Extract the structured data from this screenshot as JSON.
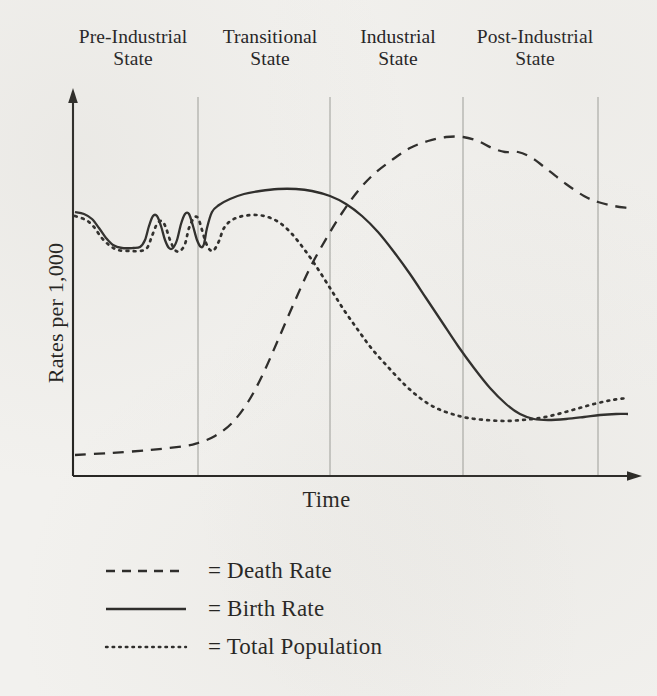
{
  "figure": {
    "stages": [
      {
        "name": "pre-industrial",
        "line1": "Pre-Industrial",
        "line2": "State"
      },
      {
        "name": "transitional",
        "line1": "Transitional",
        "line2": "State"
      },
      {
        "name": "industrial",
        "line1": "Industrial",
        "line2": "State"
      },
      {
        "name": "post-industrial",
        "line1": "Post-Industrial",
        "line2": "State"
      }
    ],
    "y_axis_title": "Rates per 1,000",
    "x_axis_title": "Time",
    "legend": [
      {
        "key": "death",
        "style": "dashed",
        "label": "= Death Rate"
      },
      {
        "key": "birth",
        "style": "solid",
        "label": "= Birth Rate"
      },
      {
        "key": "population",
        "style": "dotted",
        "label": "= Total Population"
      }
    ],
    "colors": {
      "page_background": "#f2f1ee",
      "ink": "#1f1e1c",
      "curve": "#2b2a28",
      "divider": "#b9b8b4",
      "axis": "#262522"
    }
  },
  "chart_data": {
    "type": "line",
    "title": "",
    "subtitle": "",
    "xlabel": "Time",
    "ylabel": "Rates per 1,000",
    "grid": false,
    "legend_position": "below-plot",
    "axes": {
      "x_origin_px": 73,
      "x_end_px": 640,
      "y_top_px": 90,
      "y_baseline_px": 476,
      "x_arrow": true,
      "y_arrow": true,
      "tick_labels_x": [],
      "tick_labels_y": []
    },
    "stage_dividers_px": [
      198,
      330,
      463,
      598
    ],
    "stage_spans": [
      {
        "stage": "Pre-Industrial State",
        "from_px": 73,
        "to_px": 198
      },
      {
        "stage": "Transitional State",
        "from_px": 198,
        "to_px": 330
      },
      {
        "stage": "Industrial State",
        "from_px": 330,
        "to_px": 463
      },
      {
        "stage": "Post-Industrial State",
        "from_px": 463,
        "to_px": 598
      }
    ],
    "note": "Demographic transition model. Values are relative rates read off pixel positions; y is inverted (smaller px = higher rate). No numeric tick labels appear on either axis.",
    "series": [
      {
        "name": "Death Rate",
        "style": "dashed",
        "points_px": [
          [
            75,
            455
          ],
          [
            110,
            453
          ],
          [
            150,
            450
          ],
          [
            185,
            446
          ],
          [
            198,
            443
          ],
          [
            215,
            436
          ],
          [
            232,
            423
          ],
          [
            248,
            402
          ],
          [
            263,
            374
          ],
          [
            278,
            340
          ],
          [
            294,
            303
          ],
          [
            310,
            268
          ],
          [
            326,
            239
          ],
          [
            342,
            213
          ],
          [
            358,
            191
          ],
          [
            374,
            174
          ],
          [
            392,
            160
          ],
          [
            410,
            148
          ],
          [
            428,
            141
          ],
          [
            446,
            137
          ],
          [
            463,
            137
          ],
          [
            478,
            141
          ],
          [
            492,
            148
          ],
          [
            505,
            152
          ],
          [
            518,
            152
          ],
          [
            532,
            158
          ],
          [
            548,
            170
          ],
          [
            566,
            184
          ],
          [
            584,
            196
          ],
          [
            598,
            202
          ],
          [
            614,
            206
          ],
          [
            628,
            208
          ]
        ]
      },
      {
        "name": "Birth Rate",
        "style": "solid",
        "points_px": [
          [
            75,
            212
          ],
          [
            84,
            214
          ],
          [
            92,
            219
          ],
          [
            99,
            228
          ],
          [
            106,
            238
          ],
          [
            113,
            245
          ],
          [
            122,
            248
          ],
          [
            133,
            248
          ],
          [
            140,
            247
          ],
          [
            145,
            240
          ],
          [
            149,
            226
          ],
          [
            153,
            216
          ],
          [
            157,
            216
          ],
          [
            161,
            226
          ],
          [
            165,
            240
          ],
          [
            169,
            248
          ],
          [
            173,
            248
          ],
          [
            177,
            240
          ],
          [
            181,
            224
          ],
          [
            185,
            214
          ],
          [
            189,
            214
          ],
          [
            193,
            226
          ],
          [
            197,
            240
          ],
          [
            201,
            247
          ],
          [
            204,
            244
          ],
          [
            207,
            228
          ],
          [
            212,
            212
          ],
          [
            219,
            205
          ],
          [
            230,
            199
          ],
          [
            244,
            194
          ],
          [
            260,
            191
          ],
          [
            278,
            189
          ],
          [
            296,
            189
          ],
          [
            312,
            191
          ],
          [
            330,
            196
          ],
          [
            346,
            204
          ],
          [
            362,
            216
          ],
          [
            378,
            232
          ],
          [
            394,
            252
          ],
          [
            410,
            274
          ],
          [
            426,
            298
          ],
          [
            442,
            322
          ],
          [
            458,
            346
          ],
          [
            474,
            368
          ],
          [
            490,
            388
          ],
          [
            506,
            404
          ],
          [
            520,
            414
          ],
          [
            534,
            419
          ],
          [
            548,
            420
          ],
          [
            566,
            419
          ],
          [
            584,
            417
          ],
          [
            600,
            415
          ],
          [
            616,
            414
          ],
          [
            628,
            414
          ]
        ]
      },
      {
        "name": "Total Population",
        "style": "dotted",
        "points_px": [
          [
            75,
            216
          ],
          [
            86,
            220
          ],
          [
            94,
            227
          ],
          [
            101,
            237
          ],
          [
            109,
            245
          ],
          [
            118,
            250
          ],
          [
            130,
            251
          ],
          [
            140,
            251
          ],
          [
            147,
            248
          ],
          [
            152,
            236
          ],
          [
            157,
            224
          ],
          [
            162,
            221
          ],
          [
            166,
            228
          ],
          [
            170,
            240
          ],
          [
            175,
            250
          ],
          [
            180,
            251
          ],
          [
            185,
            244
          ],
          [
            189,
            228
          ],
          [
            194,
            218
          ],
          [
            198,
            218
          ],
          [
            202,
            230
          ],
          [
            206,
            243
          ],
          [
            210,
            250
          ],
          [
            214,
            250
          ],
          [
            219,
            241
          ],
          [
            224,
            228
          ],
          [
            232,
            220
          ],
          [
            243,
            216
          ],
          [
            256,
            215
          ],
          [
            268,
            217
          ],
          [
            280,
            223
          ],
          [
            292,
            234
          ],
          [
            304,
            249
          ],
          [
            316,
            266
          ],
          [
            330,
            288
          ],
          [
            344,
            310
          ],
          [
            358,
            330
          ],
          [
            372,
            349
          ],
          [
            388,
            367
          ],
          [
            404,
            384
          ],
          [
            420,
            398
          ],
          [
            436,
            408
          ],
          [
            452,
            414
          ],
          [
            468,
            418
          ],
          [
            486,
            420
          ],
          [
            504,
            421
          ],
          [
            522,
            420
          ],
          [
            540,
            418
          ],
          [
            558,
            414
          ],
          [
            576,
            409
          ],
          [
            594,
            404
          ],
          [
            612,
            400
          ],
          [
            628,
            398
          ]
        ]
      }
    ]
  }
}
